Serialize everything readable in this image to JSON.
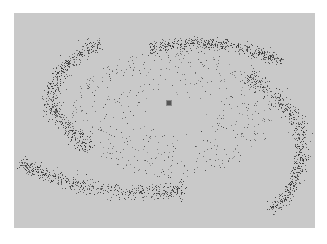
{
  "image": {
    "description": "Spiral galaxy particle simulation rendered as scattered dark points on a gray panel",
    "colors": {
      "page_background": "#ffffff",
      "panel_background": "#c9c9c9",
      "particle": "#3a3a3a",
      "core": "#555555"
    },
    "panel": {
      "x": 14,
      "y": 13,
      "width": 301,
      "height": 215
    },
    "core": {
      "x": 169,
      "y": 103
    },
    "arms": [
      {
        "name": "upper-left-arm",
        "path": [
          [
            100,
            41
          ],
          [
            88,
            48
          ],
          [
            75,
            57
          ],
          [
            64,
            67
          ],
          [
            56,
            78
          ],
          [
            51,
            90
          ],
          [
            50,
            101
          ],
          [
            54,
            112
          ],
          [
            62,
            122
          ],
          [
            72,
            132
          ],
          [
            80,
            140
          ],
          [
            88,
            150
          ]
        ],
        "width_start": 10,
        "width_end": 14,
        "count": 520
      },
      {
        "name": "top-arm",
        "path": [
          [
            150,
            48
          ],
          [
            170,
            45
          ],
          [
            190,
            43
          ],
          [
            210,
            43
          ],
          [
            230,
            45
          ],
          [
            250,
            50
          ],
          [
            265,
            55
          ],
          [
            282,
            60
          ]
        ],
        "width_start": 11,
        "width_end": 8,
        "count": 460
      },
      {
        "name": "right-arm",
        "path": [
          [
            245,
            75
          ],
          [
            262,
            85
          ],
          [
            280,
            100
          ],
          [
            295,
            118
          ],
          [
            302,
            138
          ],
          [
            300,
            160
          ],
          [
            295,
            180
          ],
          [
            285,
            198
          ],
          [
            270,
            210
          ]
        ],
        "width_start": 14,
        "width_end": 10,
        "count": 560
      },
      {
        "name": "bottom-arm",
        "path": [
          [
            20,
            163
          ],
          [
            35,
            170
          ],
          [
            55,
            178
          ],
          [
            80,
            185
          ],
          [
            110,
            190
          ],
          [
            140,
            193
          ],
          [
            165,
            192
          ],
          [
            185,
            188
          ]
        ],
        "width_start": 10,
        "width_end": 14,
        "count": 520
      }
    ],
    "disk": {
      "cx": 172,
      "cy": 113,
      "rx": 120,
      "ry": 75,
      "count": 520
    },
    "seed": 1234
  }
}
